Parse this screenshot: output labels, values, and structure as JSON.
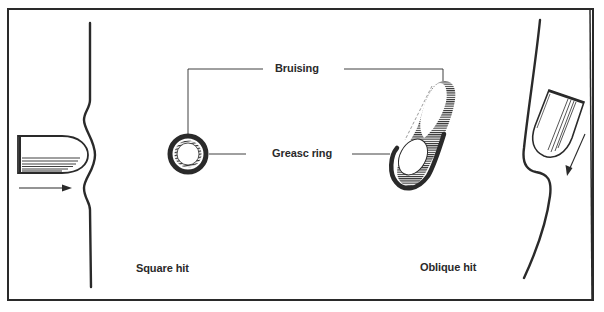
{
  "diagram": {
    "labels": {
      "bruising": "Bruising",
      "grease_ring": "Greasc ring",
      "square_hit": "Square hit",
      "oblique_hit": "Oblique hit"
    },
    "panels": [
      {
        "name": "square-hit",
        "caption": "Square hit",
        "description": "Bullet striking skin perpendicularly, producing a circular wound with a uniform bruise and grease ring"
      },
      {
        "name": "oblique-hit",
        "caption": "Oblique hit",
        "description": "Bullet striking skin at an angle, producing an elongated wound with eccentric bruising and grease ring"
      }
    ],
    "colors": {
      "ink": "#2a2a2a",
      "background": "#ffffff"
    }
  }
}
